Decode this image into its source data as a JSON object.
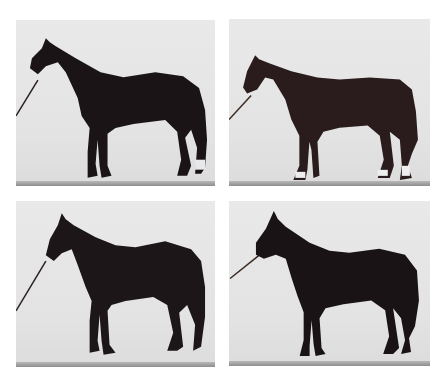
{
  "figure": {
    "layout": "2x2 grid",
    "background": "#ffffff",
    "panel_background": "#e6e6e6",
    "panels": [
      {
        "position": "top-left",
        "subject": "dark horse standing in profile facing left, led by halter rope",
        "coat_color": "#1a1416",
        "markings": "white sock on right hind"
      },
      {
        "position": "top-right",
        "subject": "bay horse standing in profile facing left, led by halter rope",
        "coat_color": "#2a1c1c",
        "markings": "white socks on three legs"
      },
      {
        "position": "bottom-left",
        "subject": "dark horse standing in profile facing left, led by halter rope",
        "coat_color": "#1d1618",
        "markings": "none"
      },
      {
        "position": "bottom-right",
        "subject": "dark horse standing in profile facing left, led by halter rope",
        "coat_color": "#1a1315",
        "markings": "none"
      }
    ]
  }
}
